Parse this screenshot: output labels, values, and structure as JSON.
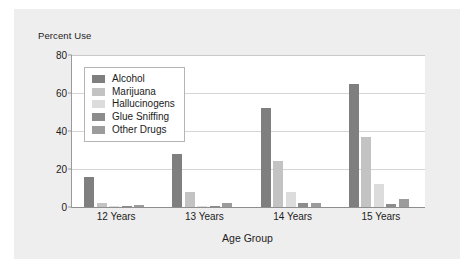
{
  "figure": {
    "background_color": "#efeeee",
    "plot_background_color": "#ffffff"
  },
  "chart_data": {
    "type": "bar",
    "title": "",
    "ylabel": "Percent Use",
    "xlabel": "Age Group",
    "categories": [
      "12 Years",
      "13 Years",
      "14 Years",
      "15 Years"
    ],
    "ylim": [
      0,
      80
    ],
    "yticks": [
      0,
      20,
      40,
      60,
      80
    ],
    "ytick_labels": [
      "0",
      "20",
      "40",
      "60",
      "80"
    ],
    "grid": true,
    "legend_position": "upper-left-inside",
    "series": [
      {
        "name": "Alcohol",
        "color": "#7f7f7f",
        "values": [
          16,
          28,
          52,
          65
        ]
      },
      {
        "name": "Marijuana",
        "color": "#c3c3c3",
        "values": [
          2,
          8,
          24,
          37
        ]
      },
      {
        "name": "Hallucinogens",
        "color": "#dcdcdc",
        "values": [
          0.3,
          0.3,
          8,
          12
        ]
      },
      {
        "name": "Glue Sniffing",
        "color": "#8c8c8c",
        "values": [
          0.3,
          0.3,
          2,
          1.5
        ]
      },
      {
        "name": "Other Drugs",
        "color": "#9c9c9c",
        "values": [
          1,
          2,
          2,
          4
        ]
      }
    ]
  }
}
